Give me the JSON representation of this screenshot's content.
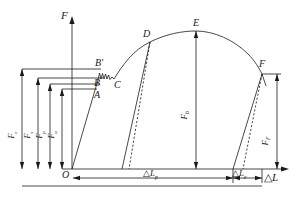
{
  "figure": {
    "type": "force-elongation-curve",
    "axes": {
      "y_label": "F",
      "x_label_delta": "△",
      "x_label_var": "L"
    },
    "origin_label": "O",
    "curve_points": [
      {
        "id": "A",
        "label": "A"
      },
      {
        "id": "B",
        "label": "B"
      },
      {
        "id": "Bp",
        "label": "B"
      },
      {
        "id": "Bp_prime",
        "label": "′"
      },
      {
        "id": "C",
        "label": "C"
      },
      {
        "id": "D",
        "label": "D"
      },
      {
        "id": "E",
        "label": "E"
      },
      {
        "id": "F",
        "label": "F"
      }
    ],
    "vertical_dimensions": [
      {
        "id": "dim-Fe",
        "base": "F",
        "sub": "e"
      },
      {
        "id": "dim-Fs",
        "base": "F",
        "sub": "s"
      },
      {
        "id": "dim-Fp",
        "base": "F",
        "sub": "p"
      },
      {
        "id": "dim-Fa",
        "base": "F",
        "sub": "a"
      },
      {
        "id": "dim-Fb",
        "base": "F",
        "sub": "b"
      },
      {
        "id": "dim-FF",
        "base": "F",
        "sub": "F"
      }
    ],
    "horizontal_dimensions": [
      {
        "id": "dim-dLp",
        "delta": "△",
        "base": "L",
        "sub": "p"
      },
      {
        "id": "dim-dLe",
        "delta": "△",
        "base": "L",
        "sub": "e"
      }
    ],
    "colors": {
      "line": "#1a1a1a",
      "background": "#ffffff"
    }
  }
}
